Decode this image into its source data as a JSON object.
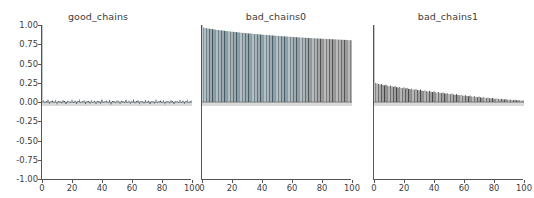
{
  "figure": {
    "width": 534,
    "height": 198,
    "background": "#ffffff",
    "style": "matplotlib-autocorrelation-grid"
  },
  "chart_data": [
    {
      "type": "bar",
      "title": "good_chains",
      "xlabel": "",
      "ylabel": "",
      "xlim": [
        0,
        100
      ],
      "ylim": [
        -1.0,
        1.0
      ],
      "xticks": [
        0,
        20,
        40,
        60,
        80,
        100
      ],
      "xticklabels": [
        "0",
        "20",
        "40",
        "60",
        "80",
        "100"
      ],
      "yticks": [
        1.0,
        0.75,
        0.5,
        0.25,
        0.0,
        -0.25,
        -0.5,
        -0.75,
        -1.0
      ],
      "yticklabels": [
        "1.00",
        "0.75",
        "0.50",
        "0.25",
        "0.00",
        "-0.25",
        "-0.50",
        "-0.75",
        "-1.00"
      ],
      "grid": false,
      "legend": "none",
      "bar_color": "#2f4550",
      "baseline_color": "#d9d9d9",
      "x": [
        0,
        1,
        2,
        3,
        4,
        5,
        6,
        7,
        8,
        9,
        10,
        11,
        12,
        13,
        14,
        15,
        16,
        17,
        18,
        19,
        20,
        21,
        22,
        23,
        24,
        25,
        26,
        27,
        28,
        29,
        30,
        31,
        32,
        33,
        34,
        35,
        36,
        37,
        38,
        39,
        40,
        41,
        42,
        43,
        44,
        45,
        46,
        47,
        48,
        49,
        50,
        51,
        52,
        53,
        54,
        55,
        56,
        57,
        58,
        59,
        60,
        61,
        62,
        63,
        64,
        65,
        66,
        67,
        68,
        69,
        70,
        71,
        72,
        73,
        74,
        75,
        76,
        77,
        78,
        79,
        80,
        81,
        82,
        83,
        84,
        85,
        86,
        87,
        88,
        89,
        90,
        91,
        92,
        93,
        94,
        95,
        96,
        97,
        98,
        99,
        100
      ],
      "values": [
        1.0,
        0.021,
        -0.014,
        0.009,
        0.031,
        -0.022,
        0.006,
        0.018,
        -0.009,
        0.027,
        -0.031,
        0.012,
        0.004,
        -0.018,
        0.022,
        0.008,
        -0.026,
        0.014,
        0.002,
        -0.011,
        0.029,
        -0.006,
        0.017,
        -0.023,
        0.009,
        0.033,
        -0.015,
        0.004,
        0.021,
        -0.028,
        0.011,
        0.006,
        -0.019,
        0.024,
        -0.003,
        0.016,
        -0.027,
        0.008,
        0.013,
        -0.021,
        0.03,
        -0.009,
        0.005,
        0.019,
        -0.014,
        0.026,
        -0.031,
        0.01,
        0.003,
        -0.017,
        0.022,
        0.007,
        -0.024,
        0.015,
        0.001,
        -0.012,
        0.028,
        -0.005,
        0.018,
        -0.022,
        0.009,
        0.032,
        -0.016,
        0.004,
        0.02,
        -0.029,
        0.012,
        0.006,
        -0.02,
        0.025,
        -0.002,
        0.015,
        -0.026,
        0.009,
        0.014,
        -0.022,
        0.031,
        -0.008,
        0.005,
        0.018,
        -0.013,
        0.027,
        -0.03,
        0.011,
        0.002,
        -0.016,
        0.023,
        0.006,
        -0.025,
        0.013,
        0.001,
        -0.01,
        0.029,
        -0.004,
        0.017,
        -0.021,
        0.008,
        0.03,
        -0.015,
        0.003,
        0.019
      ]
    },
    {
      "type": "bar",
      "title": "bad_chains0",
      "xlabel": "",
      "ylabel": "",
      "xlim": [
        0,
        100
      ],
      "ylim": [
        -1.0,
        1.0
      ],
      "xticks": [
        0,
        20,
        40,
        60,
        80,
        100
      ],
      "xticklabels": [
        "0",
        "20",
        "40",
        "60",
        "80",
        "100"
      ],
      "yticks": [
        1.0,
        0.75,
        0.5,
        0.25,
        0.0,
        -0.25,
        -0.5,
        -0.75,
        -1.0
      ],
      "yticklabels": [
        "1.00",
        "0.75",
        "0.50",
        "0.25",
        "0.00",
        "-0.25",
        "-0.50",
        "-0.75",
        "-1.00"
      ],
      "grid": false,
      "legend": "none",
      "bar_color": "#34505a",
      "bar_color_alt": "#3e3e3e",
      "baseline_color": "#d9d9d9",
      "x": [
        0,
        1,
        2,
        3,
        4,
        5,
        6,
        7,
        8,
        9,
        10,
        11,
        12,
        13,
        14,
        15,
        16,
        17,
        18,
        19,
        20,
        21,
        22,
        23,
        24,
        25,
        26,
        27,
        28,
        29,
        30,
        31,
        32,
        33,
        34,
        35,
        36,
        37,
        38,
        39,
        40,
        41,
        42,
        43,
        44,
        45,
        46,
        47,
        48,
        49,
        50,
        51,
        52,
        53,
        54,
        55,
        56,
        57,
        58,
        59,
        60,
        61,
        62,
        63,
        64,
        65,
        66,
        67,
        68,
        69,
        70,
        71,
        72,
        73,
        74,
        75,
        76,
        77,
        78,
        79,
        80,
        81,
        82,
        83,
        84,
        85,
        86,
        87,
        88,
        89,
        90,
        91,
        92,
        93,
        94,
        95,
        96,
        97,
        98,
        99,
        100
      ],
      "values": [
        1.0,
        0.968,
        0.962,
        0.959,
        0.955,
        0.952,
        0.949,
        0.946,
        0.943,
        0.94,
        0.937,
        0.935,
        0.932,
        0.93,
        0.927,
        0.925,
        0.922,
        0.92,
        0.918,
        0.916,
        0.913,
        0.911,
        0.909,
        0.907,
        0.905,
        0.903,
        0.901,
        0.899,
        0.897,
        0.895,
        0.893,
        0.891,
        0.889,
        0.888,
        0.886,
        0.884,
        0.882,
        0.88,
        0.879,
        0.877,
        0.875,
        0.874,
        0.872,
        0.87,
        0.869,
        0.867,
        0.866,
        0.864,
        0.863,
        0.861,
        0.86,
        0.858,
        0.857,
        0.855,
        0.854,
        0.852,
        0.851,
        0.85,
        0.848,
        0.847,
        0.846,
        0.844,
        0.843,
        0.842,
        0.84,
        0.839,
        0.838,
        0.837,
        0.836,
        0.834,
        0.833,
        0.832,
        0.831,
        0.83,
        0.828,
        0.827,
        0.826,
        0.825,
        0.824,
        0.823,
        0.822,
        0.821,
        0.82,
        0.819,
        0.818,
        0.817,
        0.816,
        0.815,
        0.814,
        0.813,
        0.812,
        0.811,
        0.81,
        0.809,
        0.808,
        0.807,
        0.806,
        0.805,
        0.804,
        0.803,
        0.802
      ]
    },
    {
      "type": "bar",
      "title": "bad_chains1",
      "xlabel": "",
      "ylabel": "",
      "xlim": [
        0,
        100
      ],
      "ylim": [
        -1.0,
        1.0
      ],
      "xticks": [
        0,
        20,
        40,
        60,
        80,
        100
      ],
      "xticklabels": [
        "0",
        "20",
        "40",
        "60",
        "80",
        "100"
      ],
      "yticks": [
        1.0,
        0.75,
        0.5,
        0.25,
        0.0,
        -0.25,
        -0.5,
        -0.75,
        -1.0
      ],
      "yticklabels": [
        "1.00",
        "0.75",
        "0.50",
        "0.25",
        "0.00",
        "-0.25",
        "-0.50",
        "-0.75",
        "-1.00"
      ],
      "grid": false,
      "legend": "none",
      "bar_color": "#3a3a3a",
      "baseline_color": "#d9d9d9",
      "x": [
        0,
        1,
        2,
        3,
        4,
        5,
        6,
        7,
        8,
        9,
        10,
        11,
        12,
        13,
        14,
        15,
        16,
        17,
        18,
        19,
        20,
        21,
        22,
        23,
        24,
        25,
        26,
        27,
        28,
        29,
        30,
        31,
        32,
        33,
        34,
        35,
        36,
        37,
        38,
        39,
        40,
        41,
        42,
        43,
        44,
        45,
        46,
        47,
        48,
        49,
        50,
        51,
        52,
        53,
        54,
        55,
        56,
        57,
        58,
        59,
        60,
        61,
        62,
        63,
        64,
        65,
        66,
        67,
        68,
        69,
        70,
        71,
        72,
        73,
        74,
        75,
        76,
        77,
        78,
        79,
        80,
        81,
        82,
        83,
        84,
        85,
        86,
        87,
        88,
        89,
        90,
        91,
        92,
        93,
        94,
        95,
        96,
        97,
        98,
        99,
        100
      ],
      "values": [
        1.0,
        0.249,
        0.241,
        0.236,
        0.228,
        0.233,
        0.221,
        0.216,
        0.224,
        0.21,
        0.206,
        0.214,
        0.202,
        0.197,
        0.205,
        0.193,
        0.188,
        0.196,
        0.185,
        0.18,
        0.19,
        0.176,
        0.183,
        0.171,
        0.167,
        0.175,
        0.163,
        0.159,
        0.168,
        0.155,
        0.151,
        0.16,
        0.147,
        0.143,
        0.152,
        0.14,
        0.136,
        0.145,
        0.133,
        0.129,
        0.137,
        0.126,
        0.122,
        0.13,
        0.119,
        0.115,
        0.123,
        0.112,
        0.108,
        0.116,
        0.105,
        0.101,
        0.109,
        0.098,
        0.094,
        0.102,
        0.091,
        0.087,
        0.095,
        0.084,
        0.081,
        0.088,
        0.078,
        0.075,
        0.082,
        0.072,
        0.069,
        0.076,
        0.066,
        0.063,
        0.07,
        0.06,
        0.057,
        0.064,
        0.055,
        0.052,
        0.058,
        0.049,
        0.047,
        0.053,
        0.044,
        0.042,
        0.047,
        0.039,
        0.037,
        0.042,
        0.035,
        0.033,
        0.037,
        0.031,
        0.029,
        0.033,
        0.027,
        0.025,
        0.029,
        0.023,
        0.021,
        0.025,
        0.019,
        0.018,
        0.021
      ]
    }
  ]
}
